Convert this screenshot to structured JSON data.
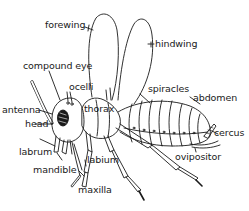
{
  "diagram": {
    "line_color": "#1a1a1a",
    "background": "#ffffff",
    "labels": {
      "forewing": "forewing",
      "hindwing": "hindwing",
      "compound_eye": "compound eye",
      "ocelli": "ocelli",
      "antenna": "antenna",
      "thorax": "thorax",
      "spiracles": "spiracles",
      "abdomen": "abdomen",
      "head": "head",
      "labrum": "labrum",
      "mandible": "mandible",
      "labium": "labium",
      "maxilla": "maxilla",
      "cercus": "cercus",
      "ovipositor": "ovipositor"
    }
  }
}
